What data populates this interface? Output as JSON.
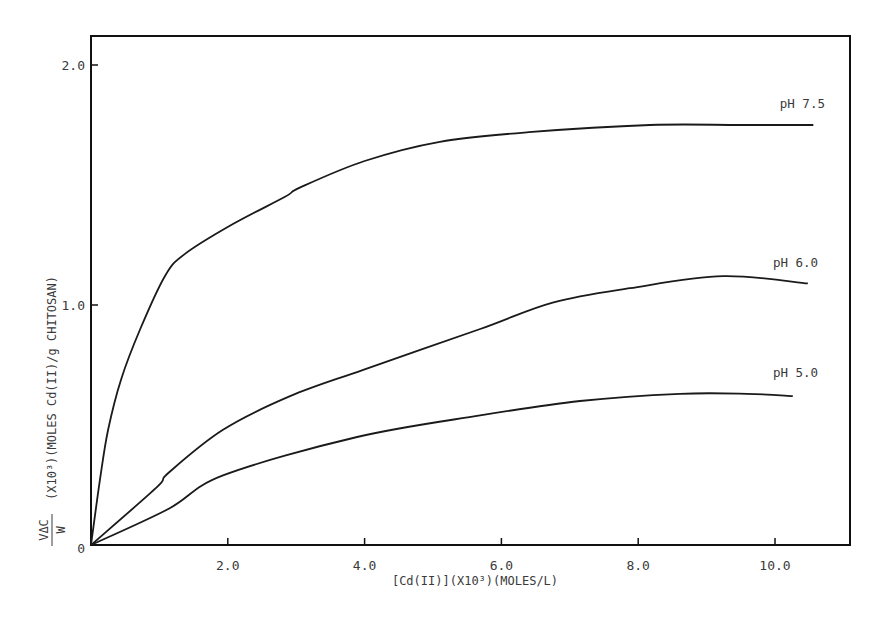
{
  "chart_data": {
    "type": "line",
    "title": "",
    "xlabel": "[Cd(II)](X10³)(MOLES/L)",
    "ylabel": "VΔC/W (X10³)(MOLES Cd(II)/g CHITOSAN)",
    "ylabel_fraction": {
      "numerator": "VΔC",
      "denominator": "W"
    },
    "ylabel_rest": "(X10³)(MOLES Cd(II)/g CHITOSAN)",
    "xlim": [
      0,
      11.3
    ],
    "ylim": [
      0,
      2.15
    ],
    "xticks": [
      0,
      2.0,
      4.0,
      6.0,
      8.0,
      10.0
    ],
    "xtick_labels": [
      "",
      "2.0",
      "4.0",
      "6.0",
      "8.0",
      "10.0"
    ],
    "yticks": [
      0,
      1.0,
      2.0
    ],
    "ytick_labels": [
      "0",
      "1.0",
      "2.0"
    ],
    "grid": false,
    "legend_position": "inline labels at right end of curves",
    "series": [
      {
        "name": "pH 7.5",
        "x": [
          0,
          0.13,
          0.25,
          0.44,
          0.72,
          1.08,
          1.36,
          2.03,
          2.83,
          3.06,
          4.0,
          5.1,
          6.4,
          8.17,
          9.5,
          10.56
        ],
        "values": [
          0,
          0.27,
          0.48,
          0.69,
          0.9,
          1.12,
          1.21,
          1.33,
          1.45,
          1.49,
          1.6,
          1.68,
          1.72,
          1.75,
          1.75,
          1.75
        ]
      },
      {
        "name": "pH 6.0",
        "x": [
          0,
          0.96,
          1.13,
          1.93,
          2.91,
          3.98,
          5.69,
          6.75,
          7.88,
          9.24,
          10.48
        ],
        "values": [
          0,
          0.24,
          0.3,
          0.48,
          0.62,
          0.73,
          0.9,
          1.01,
          1.07,
          1.12,
          1.09
        ]
      },
      {
        "name": "pH 5.0",
        "x": [
          0,
          1.13,
          1.93,
          3.89,
          5.69,
          7.15,
          8.61,
          9.59,
          10.26
        ],
        "values": [
          0,
          0.15,
          0.29,
          0.45,
          0.54,
          0.6,
          0.63,
          0.63,
          0.62
        ]
      }
    ],
    "label_positions": {
      "pH 7.5": {
        "x": 10.4,
        "y": 1.82
      },
      "pH 6.0": {
        "x": 10.3,
        "y": 1.16
      },
      "pH 5.0": {
        "x": 10.3,
        "y": 0.7
      }
    },
    "line_color": "#1a1a1a",
    "axis_color": "#111111"
  }
}
